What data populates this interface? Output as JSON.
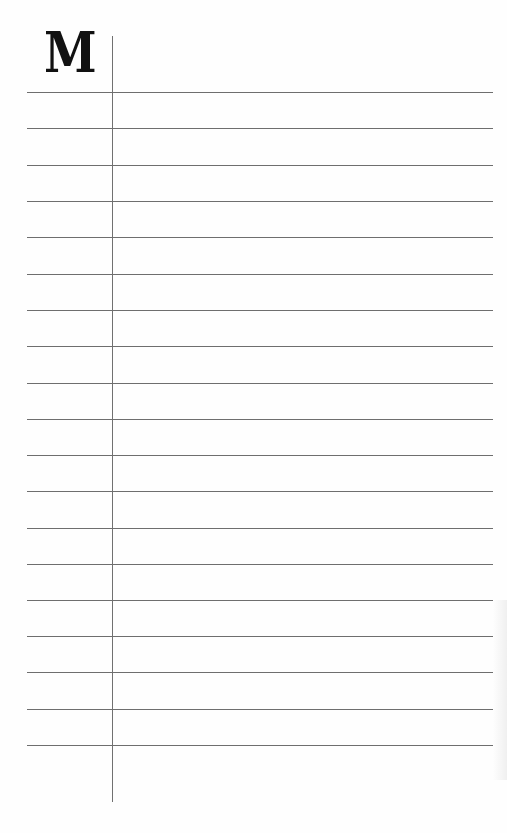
{
  "page": {
    "type": "lined-notebook-page",
    "index_letter": "M",
    "colors": {
      "background": "#fefefe",
      "rule": "#6e6e6e",
      "margin_line": "#707070",
      "letter": "#111111"
    },
    "rule_count": 19,
    "rules_y": [
      92,
      128,
      165,
      201,
      237,
      274,
      310,
      346,
      383,
      419,
      455,
      491,
      528,
      564,
      600,
      636,
      672,
      709,
      745
    ]
  }
}
